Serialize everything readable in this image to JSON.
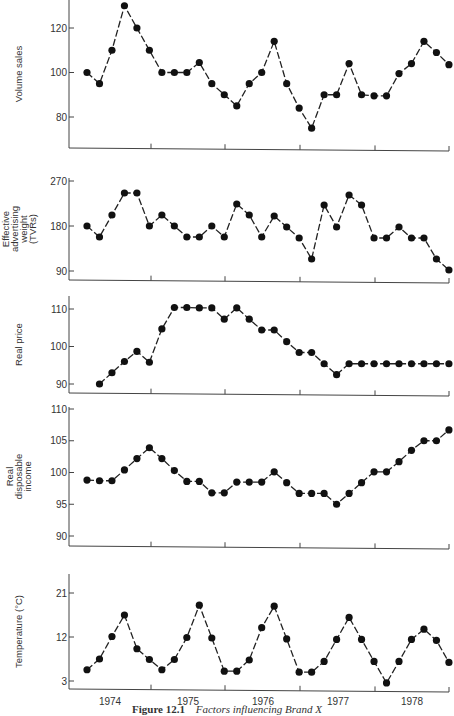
{
  "chart_data": [
    {
      "type": "line",
      "title": "",
      "xlabel": "",
      "ylabel": "Volume sales",
      "yticks": [
        80,
        100,
        120
      ],
      "ylim": [
        67,
        134
      ],
      "grid": false,
      "x_periods": 30,
      "start_index": 0,
      "values": [
        100,
        95,
        110,
        130,
        120,
        110,
        100,
        100,
        100,
        104.5,
        95,
        90,
        85,
        95,
        100,
        114,
        95,
        84,
        75,
        90,
        90,
        104,
        90,
        89.5,
        89.5,
        99.5,
        104,
        114,
        109,
        103.5
      ]
    },
    {
      "type": "line",
      "title": "",
      "xlabel": "",
      "ylabel": "Effective advertising weight (TVRs)",
      "ylabel_lines": [
        "Effective",
        "advertising",
        "weight",
        "(TVRs)"
      ],
      "yticks": [
        90,
        180,
        270
      ],
      "ylim": [
        72,
        286
      ],
      "grid": false,
      "x_periods": 30,
      "start_index": 0,
      "values": [
        180,
        158,
        202,
        246,
        246,
        180,
        202,
        180,
        158,
        158,
        180,
        158,
        224,
        202,
        158,
        200,
        178,
        156,
        114,
        222,
        178,
        242,
        222,
        156,
        156,
        178,
        156,
        156,
        114,
        92
      ]
    },
    {
      "type": "line",
      "title": "",
      "xlabel": "",
      "ylabel": "Real price",
      "yticks": [
        90,
        100,
        110
      ],
      "ylim": [
        87.5,
        114
      ],
      "grid": false,
      "x_periods": 30,
      "start_index": 1,
      "values": [
        90,
        93,
        96,
        98.7,
        95.8,
        104.7,
        110.4,
        110.4,
        110.3,
        110.3,
        107.3,
        110.3,
        107.3,
        104.4,
        104.4,
        101.3,
        98.4,
        98.4,
        95.4,
        92.5,
        95.4,
        95.4,
        95.4,
        95.4,
        95.4,
        95.4,
        95.4,
        95.4,
        95.4
      ]
    },
    {
      "type": "line",
      "title": "",
      "xlabel": "",
      "ylabel": "Real disposable income",
      "ylabel_lines": [
        "Real",
        "disposable",
        "income"
      ],
      "yticks": [
        90,
        95,
        100,
        105,
        110
      ],
      "ylim": [
        89,
        110
      ],
      "grid": false,
      "x_periods": 30,
      "start_index": 0,
      "values": [
        98.8,
        98.7,
        98.7,
        100.4,
        102.2,
        103.9,
        102.2,
        100.3,
        98.6,
        98.6,
        96.8,
        96.8,
        98.5,
        98.5,
        98.5,
        100.1,
        98.4,
        96.7,
        96.7,
        96.7,
        95.0,
        96.7,
        98.4,
        100.1,
        100.1,
        101.7,
        103.5,
        105.0,
        105.0,
        106.7
      ]
    },
    {
      "type": "line",
      "title": "",
      "xlabel": "",
      "ylabel": "Temperature (°C)",
      "yticks": [
        3,
        12,
        21
      ],
      "ylim": [
        1.3,
        24.7
      ],
      "grid": false,
      "x_periods": 30,
      "start_index": 0,
      "values": [
        5.3,
        7.5,
        12.1,
        16.5,
        9.6,
        7.4,
        5.3,
        7.4,
        11.9,
        18.5,
        11.8,
        5.0,
        5.0,
        7.3,
        13.9,
        18.3,
        11.6,
        4.8,
        4.8,
        7.0,
        11.5,
        16.0,
        11.5,
        7.0,
        2.6,
        7.0,
        11.5,
        13.6,
        11.3,
        6.8
      ],
      "xtick_labels": [
        "1974",
        "1975",
        "1976",
        "1977",
        "1978"
      ]
    }
  ],
  "panels": [
    {
      "ylabel_lines": [
        "Volume sales"
      ],
      "ytick_labels": [
        "80",
        "100",
        "120"
      ]
    },
    {
      "ylabel_lines": [
        "Effective",
        "advertising",
        "weight",
        "(TVRs)"
      ],
      "ytick_labels": [
        "90",
        "180",
        "270"
      ]
    },
    {
      "ylabel_lines": [
        "Real price"
      ],
      "ytick_labels": [
        "90",
        "100",
        "110"
      ]
    },
    {
      "ylabel_lines": [
        "Real",
        "disposable",
        "income"
      ],
      "ytick_labels": [
        "90",
        "95",
        "100",
        "105",
        "110"
      ]
    },
    {
      "ylabel_lines": [
        "Temperature (°C)"
      ],
      "ytick_labels": [
        "3",
        "12",
        "21"
      ]
    }
  ],
  "x_axis": {
    "labels": [
      "1974",
      "1975",
      "1976",
      "1977",
      "1978"
    ]
  },
  "caption": {
    "figure_number": "Figure 12.1",
    "text": "Factors influencing Brand X"
  },
  "colors": {
    "line": "#222222",
    "marker": "#111111",
    "axis": "#444444",
    "text": "#333333"
  }
}
